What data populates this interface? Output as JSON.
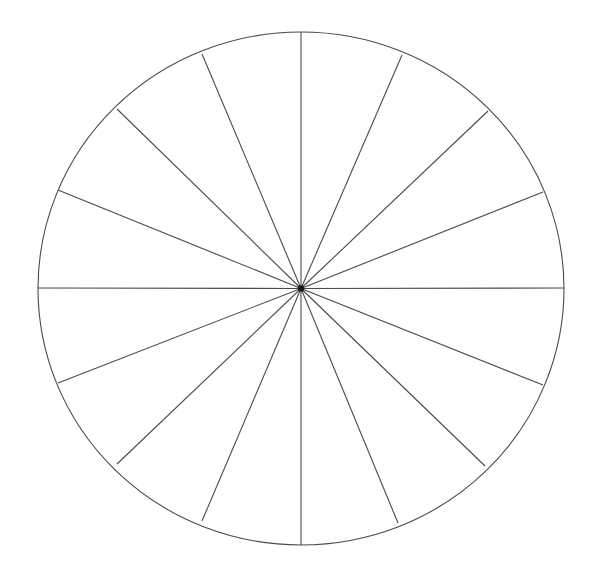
{
  "figure": {
    "name": "sixteen-sector-circle-diagram",
    "canvas": {
      "width": 599,
      "height": 571
    },
    "background_color": "#ffffff",
    "line_color": "#4a4a4a",
    "line_width": 1.1,
    "hub_color": "#1a1a1a",
    "hub_radius": 3.2
  },
  "chart_data": {
    "type": "pie",
    "subtitle": "",
    "xlabel": "",
    "ylabel": "",
    "legend_position": "none",
    "grid": false,
    "fill": "none",
    "stroke_color": "#4a4a4a",
    "center": {
      "x": 301,
      "y": 288.5
    },
    "radius_x": 263,
    "radius_y": 256.5,
    "sector_count": 16,
    "sector_angle_degrees": 22.5,
    "categories": [
      "sector-01",
      "sector-02",
      "sector-03",
      "sector-04",
      "sector-05",
      "sector-06",
      "sector-07",
      "sector-08",
      "sector-09",
      "sector-10",
      "sector-11",
      "sector-12",
      "sector-13",
      "sector-14",
      "sector-15",
      "sector-16"
    ],
    "values": [
      6.25,
      6.25,
      6.25,
      6.25,
      6.25,
      6.25,
      6.25,
      6.25,
      6.25,
      6.25,
      6.25,
      6.25,
      6.25,
      6.25,
      6.25,
      6.25
    ],
    "spoke_angles_degrees": [
      0,
      22.5,
      45,
      67.5,
      90,
      112.5,
      135,
      157.5,
      180,
      202.5,
      225,
      247.5,
      270,
      292.5,
      315,
      337.5
    ],
    "spoke_endpoints": [
      {
        "label": "spoke-up",
        "angle": 0,
        "x": 301,
        "y": 32
      },
      {
        "label": "spoke-up-right-1",
        "angle": 22.5,
        "x": 402,
        "y": 55
      },
      {
        "label": "spoke-up-right-2",
        "angle": 45,
        "x": 488,
        "y": 111
      },
      {
        "label": "spoke-up-right-3",
        "angle": 67.5,
        "x": 543,
        "y": 192
      },
      {
        "label": "spoke-right",
        "angle": 90,
        "x": 564,
        "y": 288
      },
      {
        "label": "spoke-down-right-3",
        "angle": 112.5,
        "x": 543,
        "y": 385
      },
      {
        "label": "spoke-down-right-2",
        "angle": 135,
        "x": 485,
        "y": 466
      },
      {
        "label": "spoke-down-right-1",
        "angle": 157.5,
        "x": 398,
        "y": 523
      },
      {
        "label": "spoke-down",
        "angle": 180,
        "x": 301,
        "y": 545
      },
      {
        "label": "spoke-down-left-1",
        "angle": 202.5,
        "x": 202,
        "y": 521
      },
      {
        "label": "spoke-down-left-2",
        "angle": 225,
        "x": 117,
        "y": 464
      },
      {
        "label": "spoke-down-left-3",
        "angle": 247.5,
        "x": 58,
        "y": 383
      },
      {
        "label": "spoke-left",
        "angle": 270,
        "x": 38,
        "y": 288
      },
      {
        "label": "spoke-up-left-3",
        "angle": 292.5,
        "x": 58,
        "y": 190
      },
      {
        "label": "spoke-up-left-2",
        "angle": 315,
        "x": 117,
        "y": 109
      },
      {
        "label": "spoke-up-left-1",
        "angle": 337.5,
        "x": 202,
        "y": 54
      }
    ]
  }
}
